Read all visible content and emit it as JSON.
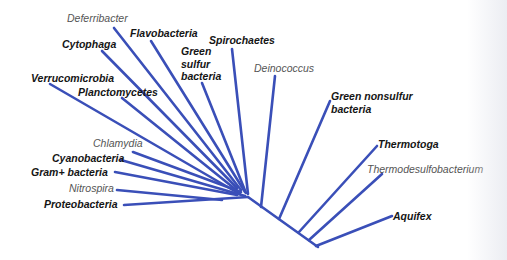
{
  "diagram": {
    "title": "",
    "type": "phylogenetic-tree",
    "line_color": "#3a4fb8",
    "line_width": 2.6,
    "nodes": {
      "left_root": [
        248,
        197
      ],
      "backbone_end": [
        318,
        247
      ]
    },
    "backbone": [
      [
        248,
        197
      ],
      [
        318,
        247
      ]
    ],
    "taxa": [
      {
        "id": "deferribacter",
        "label": "Deferribacter",
        "style": "ital",
        "label_pos": [
          67,
          12
        ],
        "line": [
          [
            114,
            28
          ],
          [
            241,
            190
          ]
        ]
      },
      {
        "id": "flavobacteria",
        "label": "Flavobacteria",
        "style": "bold",
        "label_pos": [
          130,
          27
        ],
        "line": [
          [
            151,
            41
          ],
          [
            245,
            192
          ]
        ]
      },
      {
        "id": "cytophaga",
        "label": "Cytophaga",
        "style": "bold",
        "label_pos": [
          62,
          38
        ],
        "line": [
          [
            102,
            51
          ],
          [
            237,
            188
          ]
        ]
      },
      {
        "id": "spirochaetes",
        "label": "Spirochaetes",
        "style": "bold",
        "label_pos": [
          209,
          34
        ],
        "line": [
          [
            232,
            49
          ],
          [
            248,
            194
          ]
        ]
      },
      {
        "id": "green-sulfur-bacteria",
        "label": "Green\nsulfur\nbacteria",
        "style": "bold multi",
        "label_pos": [
          181,
          45
        ],
        "line": [
          [
            202,
            83
          ],
          [
            246,
            193
          ]
        ]
      },
      {
        "id": "verrucomicrobia",
        "label": "Verrucomicrobia",
        "style": "bold",
        "label_pos": [
          31,
          72
        ],
        "line": [
          [
            50,
            84
          ],
          [
            238,
            193
          ]
        ]
      },
      {
        "id": "planctomycetes",
        "label": "Planctomycetes",
        "style": "bold",
        "label_pos": [
          78,
          86
        ],
        "line": [
          [
            122,
            98
          ],
          [
            240,
            193
          ]
        ]
      },
      {
        "id": "deinococcus",
        "label": "Deinococcus",
        "style": "ital",
        "label_pos": [
          254,
          62
        ],
        "line": [
          [
            275,
            76
          ],
          [
            261,
            207
          ]
        ]
      },
      {
        "id": "green-nonsulfur-bacteria",
        "label": "Green nonsulfur\nbacteria",
        "style": "bold multi",
        "label_pos": [
          331,
          90
        ],
        "line": [
          [
            330,
            101
          ],
          [
            279,
            219
          ]
        ]
      },
      {
        "id": "chlamydia",
        "label": "Chlamydia",
        "style": "ital",
        "label_pos": [
          93,
          137
        ],
        "line": [
          [
            133,
            152
          ],
          [
            241,
            192
          ]
        ]
      },
      {
        "id": "cyanobacteria",
        "label": "Cyanobacteria",
        "style": "bold",
        "label_pos": [
          52,
          152
        ],
        "line": [
          [
            121,
            160
          ],
          [
            245,
            196
          ]
        ]
      },
      {
        "id": "gram-positive-bacteria",
        "label": "Gram+ bacteria",
        "style": "bold",
        "label_pos": [
          31,
          166
        ],
        "line": [
          [
            115,
            172
          ],
          [
            237,
            195
          ]
        ]
      },
      {
        "id": "nitrospira",
        "label": "Nitrospira",
        "style": "ital",
        "label_pos": [
          69,
          182
        ],
        "line": [
          [
            117,
            190
          ],
          [
            222,
            200
          ]
        ]
      },
      {
        "id": "proteobacteria",
        "label": "Proteobacteria",
        "style": "bold",
        "label_pos": [
          44,
          198
        ],
        "line": [
          [
            124,
            205
          ],
          [
            248,
            197
          ]
        ]
      },
      {
        "id": "thermotoga",
        "label": "Thermotoga",
        "style": "bold",
        "label_pos": [
          378,
          138
        ],
        "line": [
          [
            377,
            146
          ],
          [
            299,
            232
          ]
        ]
      },
      {
        "id": "thermodesulfobacterium",
        "label": "Thermodesulfobacterium",
        "style": "ital",
        "label_pos": [
          367,
          163
        ],
        "line": [
          [
            382,
            174
          ],
          [
            309,
            240
          ]
        ]
      },
      {
        "id": "aquifex",
        "label": "Aquifex",
        "style": "bold",
        "label_pos": [
          393,
          210
        ],
        "line": [
          [
            392,
            216
          ],
          [
            316,
            246
          ]
        ]
      }
    ],
    "junction_stubs": [
      [
        [
          256,
          203
        ],
        [
          263,
          207
        ]
      ],
      [
        [
          316,
          243
        ],
        [
          320,
          249
        ]
      ]
    ]
  }
}
